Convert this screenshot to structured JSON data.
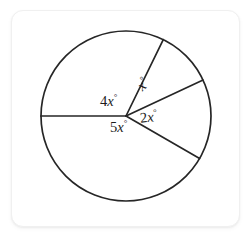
{
  "figure": {
    "shape": "circle",
    "stroke_color": "#262626",
    "fill_color": "#ffffff",
    "background_color": "#ffffff",
    "card_border_color": "#f0f0f0"
  },
  "labels": {
    "four_x": {
      "coefficient": "4",
      "variable": "x",
      "degree": "°",
      "full": "4x°"
    },
    "one_x": {
      "coefficient": "",
      "variable": "x",
      "degree": "°",
      "full": "x°"
    },
    "two_x": {
      "coefficient": "2",
      "variable": "x",
      "degree": "°",
      "full": "2x°"
    },
    "five_x": {
      "coefficient": "5",
      "variable": "x",
      "degree": "°",
      "full": "5x°"
    }
  },
  "chart_data": {
    "type": "pie",
    "title": "",
    "center": {
      "x": 126,
      "y": 116
    },
    "radius": 85,
    "categories": [
      "4x°",
      "x°",
      "2x°",
      "5x°"
    ],
    "values": [
      116,
      39,
      55,
      150
    ],
    "labels": [
      "4x°",
      "x°",
      "2x°",
      "5x°"
    ],
    "boundary_angles_deg": [
      180,
      64,
      25,
      -30
    ],
    "radii": [
      {
        "name": "radius-left",
        "angle_deg": 180,
        "x2": 41,
        "y2": 116
      },
      {
        "name": "radius-upper-right",
        "angle_deg": 64,
        "x2": 163,
        "y2": 40
      },
      {
        "name": "radius-mid-right",
        "angle_deg": 25,
        "x2": 203,
        "y2": 80
      },
      {
        "name": "radius-lower-right",
        "angle_deg": -30,
        "x2": 200,
        "y2": 159
      }
    ],
    "legend": "none",
    "grid": false
  }
}
